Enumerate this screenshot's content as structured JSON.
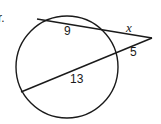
{
  "problem": {
    "number_label": "r.",
    "segments": {
      "top_internal": "9",
      "top_external": "x",
      "bottom_external": "5",
      "bottom_internal": "13"
    }
  },
  "colors": {
    "stroke": "#1a1a1a",
    "background": "#ffffff"
  }
}
